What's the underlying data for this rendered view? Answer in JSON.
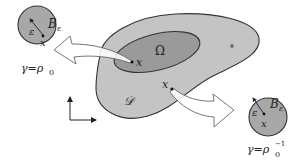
{
  "diagram": {
    "colors": {
      "background": "#ffffff",
      "domain_fill": "#c4c4c4",
      "omega_fill": "#9a9a9a",
      "ball_fill": "#a8a8a8",
      "stroke": "#333333",
      "arrow_fill": "#ffffff",
      "arrow_stroke": "#555555"
    },
    "labels": {
      "domain_D": "𝒟",
      "omega": "Ω",
      "point_x_omega": "x",
      "point_x_domain": "x",
      "ball_left": {
        "name": "B",
        "subscript": "ε",
        "radius_label": "ε",
        "center_label": "x",
        "caption_lhs": "γ=ρ",
        "caption_sub": "0",
        "caption_sup": ""
      },
      "ball_right": {
        "name": "B",
        "subscript": "ε",
        "radius_label": "ε",
        "center_label": "x",
        "caption_lhs": "γ=ρ",
        "caption_sub": "0",
        "caption_sup": "−1"
      }
    },
    "axes_icon": "coordinate-axes-icon"
  }
}
